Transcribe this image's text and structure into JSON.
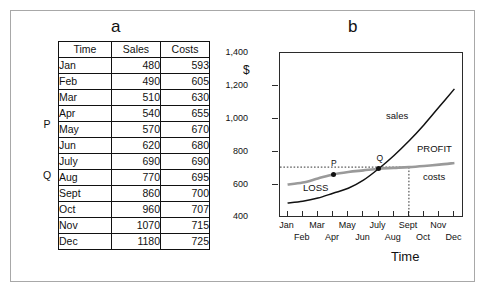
{
  "figure": {
    "panel_a_label": "a",
    "panel_b_label": "b"
  },
  "table": {
    "headers": [
      "Time",
      "Sales",
      "Costs"
    ],
    "rows": [
      {
        "time": "Jan",
        "sales": "480",
        "costs": "593"
      },
      {
        "time": "Feb",
        "sales": "490",
        "costs": "605"
      },
      {
        "time": "Mar",
        "sales": "510",
        "costs": "630"
      },
      {
        "time": "Apr",
        "sales": "540",
        "costs": "655"
      },
      {
        "time": "May",
        "sales": "570",
        "costs": "670"
      },
      {
        "time": "Jun",
        "sales": "620",
        "costs": "680"
      },
      {
        "time": "July",
        "sales": "690",
        "costs": "690"
      },
      {
        "time": "Aug",
        "sales": "770",
        "costs": "695"
      },
      {
        "time": "Sept",
        "sales": "860",
        "costs": "700"
      },
      {
        "time": "Oct",
        "sales": "960",
        "costs": "707"
      },
      {
        "time": "Nov",
        "sales": "1070",
        "costs": "715"
      },
      {
        "time": "Dec",
        "sales": "1180",
        "costs": "725"
      }
    ],
    "row_markers": [
      {
        "label": "P",
        "row_index": 3
      },
      {
        "label": "Q",
        "row_index": 6
      }
    ]
  },
  "chart_data": {
    "type": "line",
    "title": "b",
    "xlabel": "Time",
    "ylabel": "$",
    "ylim": [
      400,
      1400
    ],
    "yticks": [
      "400",
      "600",
      "800",
      "1,000",
      "1,200",
      "1,400"
    ],
    "grid": false,
    "legend": "inline-annotations",
    "categories": [
      "Jan",
      "Feb",
      "Mar",
      "Apr",
      "May",
      "Jun",
      "July",
      "Aug",
      "Sept",
      "Oct",
      "Nov",
      "Dec"
    ],
    "series": [
      {
        "name": "sales",
        "color": "#111111",
        "values": [
          480,
          490,
          510,
          540,
          570,
          620,
          690,
          770,
          860,
          960,
          1070,
          1180
        ]
      },
      {
        "name": "costs",
        "color": "#9a9a9a",
        "values": [
          593,
          605,
          630,
          655,
          670,
          680,
          690,
          695,
          700,
          707,
          715,
          725
        ]
      }
    ],
    "annotations": [
      {
        "label": "sales",
        "kind": "series-label",
        "x": "Jun",
        "y": 1000
      },
      {
        "label": "costs",
        "kind": "series-label",
        "x": "Oct",
        "y": 640
      },
      {
        "label": "PROFIT",
        "kind": "region-label",
        "x": "Sept",
        "y": 800
      },
      {
        "label": "LOSS",
        "kind": "region-label",
        "x": "Mar",
        "y": 560
      },
      {
        "label": "P",
        "kind": "point",
        "x": "Apr",
        "y": 655
      },
      {
        "label": "Q",
        "kind": "point",
        "x": "July",
        "y": 690
      }
    ],
    "guides": [
      {
        "kind": "horizontal-dotted",
        "y": 700,
        "from_x": "Jan",
        "to_x": "Sept"
      },
      {
        "kind": "vertical-dotted",
        "x": "Sept",
        "from_y": 400,
        "to_y": 700
      }
    ]
  }
}
